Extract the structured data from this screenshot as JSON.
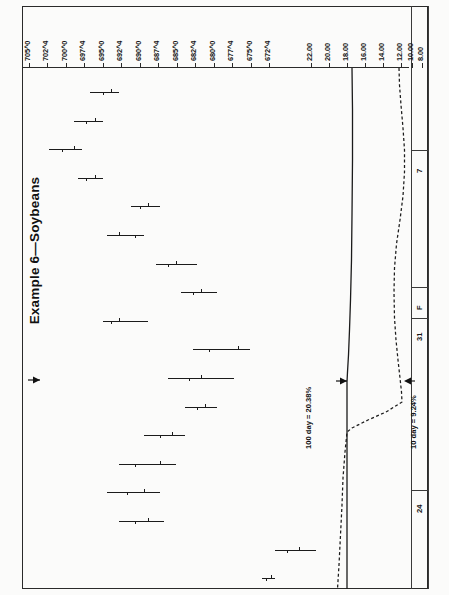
{
  "figure": {
    "title": "Example 6—Soybeans",
    "orientation": "rotated-90",
    "frame_color": "#2a2a2a"
  },
  "annotations": [
    {
      "name": "hundred-day-label",
      "text": "100 day = 20.38%"
    },
    {
      "name": "ten-day-label",
      "text": "10 day = 9.24%"
    }
  ],
  "date_axis": {
    "name": "date-axis",
    "labels": [
      "7",
      "F",
      "31",
      "24"
    ]
  },
  "chart_data": {
    "type": "line",
    "title": "Example 6—Soybeans",
    "subtitle": "",
    "xlabel": "",
    "ylabel": "",
    "grid": false,
    "legend_position": "none",
    "price_axis": {
      "name": "price-scale",
      "unit": "cents-and-eighths",
      "ticks": [
        "705^0",
        "702^4",
        "700^0",
        "697^4",
        "695^0",
        "692^4",
        "690^0",
        "687^4",
        "685^0",
        "682^4",
        "680^0",
        "677^4",
        "675^0",
        "672^4"
      ],
      "values": [
        705.0,
        702.5,
        700.0,
        697.5,
        695.0,
        692.5,
        690.0,
        687.5,
        685.0,
        682.5,
        680.0,
        677.5,
        675.0,
        672.5
      ],
      "range": [
        672.5,
        705.0
      ]
    },
    "volatility_axis": {
      "name": "volatility-scale",
      "unit": "percent",
      "ticks": [
        "22.00",
        "20.00",
        "18.00",
        "16.00",
        "14.00",
        "12.00",
        "10.00",
        "8.00"
      ],
      "values": [
        22.0,
        20.0,
        18.0,
        16.0,
        14.0,
        12.0,
        10.0,
        8.0
      ],
      "range": [
        8.0,
        22.0
      ]
    },
    "categories": [
      "d1",
      "d2",
      "d3",
      "d4",
      "d5",
      "d6",
      "d7",
      "d8",
      "d9",
      "d10",
      "d11",
      "d12",
      "d13",
      "d14",
      "d15",
      "d16",
      "d17",
      "d18"
    ],
    "series": [
      {
        "name": "price-bars",
        "style": "ohlc",
        "high": [
          681.0,
          679.0,
          676.5,
          679.0,
          686.0,
          684.0,
          690.5,
          693.0,
          684.5,
          697.0,
          695.0,
          693.0,
          689.0,
          688.0,
          686.0,
          686.5,
          705.0,
          700.0
        ],
        "low": [
          677.5,
          675.5,
          672.5,
          676.0,
          682.5,
          679.5,
          685.5,
          688.5,
          679.0,
          690.0,
          687.0,
          689.0,
          684.0,
          681.0,
          679.5,
          681.0,
          700.0,
          698.5
        ],
        "open": [
          680.0,
          678.0,
          675.5,
          678.0,
          684.5,
          681.0,
          688.0,
          691.0,
          681.0,
          695.5,
          691.0,
          691.5,
          687.5,
          686.0,
          684.0,
          684.5,
          703.0,
          699.5
        ],
        "close": [
          679.0,
          677.0,
          674.0,
          677.0,
          683.5,
          683.0,
          687.0,
          690.0,
          680.0,
          692.0,
          689.5,
          690.5,
          686.0,
          683.0,
          682.0,
          683.0,
          701.5,
          699.0
        ]
      },
      {
        "name": "hundred-day-volatility",
        "style": "solid",
        "label": "100 day = 20.38%",
        "end_value": 20.38
      },
      {
        "name": "ten-day-volatility",
        "style": "dashed",
        "label": "10 day = 9.24%",
        "end_value": 9.24
      }
    ]
  }
}
